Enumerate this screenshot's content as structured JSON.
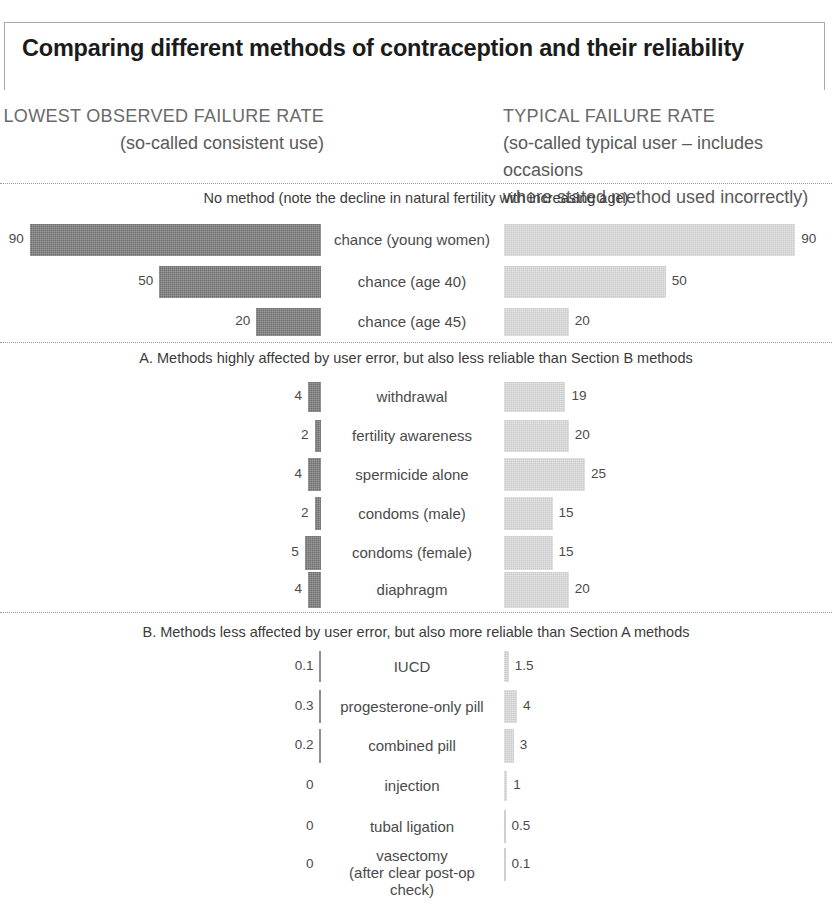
{
  "title": "Comparing different methods of contraception and their reliability",
  "headers": {
    "left_caption": "LOWEST OBSERVED FAILURE RATE",
    "left_subtitle": "(so-called consistent use)",
    "right_caption": "TYPICAL FAILURE RATE",
    "right_subtitle_line1": "(so-called typical user – includes occasions",
    "right_subtitle_line2": "where stated method used incorrectly)"
  },
  "sections": [
    {
      "banner": "No method (note the decline in natural fertility with increasing age)",
      "rows": [
        {
          "label": "chance (young women)",
          "label2": "",
          "lowest": "90",
          "typical": "90"
        },
        {
          "label": "chance (age 40)",
          "label2": "",
          "lowest": "50",
          "typical": "50"
        },
        {
          "label": "chance (age 45)",
          "label2": "",
          "lowest": "20",
          "typical": "20"
        }
      ]
    },
    {
      "banner": "A. Methods highly affected by user error, but also less reliable than Section B methods",
      "rows": [
        {
          "label": "withdrawal",
          "label2": "",
          "lowest": "4",
          "typical": "19"
        },
        {
          "label": "fertility awareness",
          "label2": "",
          "lowest": "2",
          "typical": "20"
        },
        {
          "label": "spermicide alone",
          "label2": "",
          "lowest": "4",
          "typical": "25"
        },
        {
          "label": "condoms (male)",
          "label2": "",
          "lowest": "2",
          "typical": "15"
        },
        {
          "label": "condoms (female)",
          "label2": "",
          "lowest": "5",
          "typical": "15"
        },
        {
          "label": "diaphragm",
          "label2": "",
          "lowest": "4",
          "typical": "20"
        }
      ]
    },
    {
      "banner": "B. Methods less affected by user error, but also more reliable than Section A methods",
      "rows": [
        {
          "label": "IUCD",
          "label2": "",
          "lowest": "0.1",
          "typical": "1.5"
        },
        {
          "label": "progesterone-only pill",
          "label2": "",
          "lowest": "0.3",
          "typical": "4"
        },
        {
          "label": "combined pill",
          "label2": "",
          "lowest": "0.2",
          "typical": "3"
        },
        {
          "label": "injection",
          "label2": "",
          "lowest": "0",
          "typical": "1"
        },
        {
          "label": "tubal ligation",
          "label2": "",
          "lowest": "0",
          "typical": "0.5"
        },
        {
          "label": "vasectomy",
          "label2": "(after clear post-op check)",
          "lowest": "0",
          "typical": "0.1"
        }
      ]
    }
  ],
  "chart_data": {
    "type": "bar",
    "title": "Comparing different methods of contraception and their reliability",
    "orientation": "horizontal-diverging",
    "xlabel": "",
    "ylabel": "",
    "grid": false,
    "legend_position": "top",
    "series": [
      {
        "name": "LOWEST OBSERVED FAILURE RATE (so-called consistent use)",
        "color": "#6e6e6e",
        "direction": "left",
        "values": [
          90,
          50,
          20,
          4,
          2,
          4,
          2,
          5,
          4,
          0.1,
          0.3,
          0.2,
          0,
          0,
          0
        ]
      },
      {
        "name": "TYPICAL FAILURE RATE (so-called typical user – includes occasions where stated method used incorrectly)",
        "color": "#c9c9c9",
        "direction": "right",
        "values": [
          90,
          50,
          20,
          19,
          20,
          25,
          15,
          15,
          20,
          1.5,
          4,
          3,
          1,
          0.5,
          0.1
        ]
      }
    ],
    "categories": [
      "chance (young women)",
      "chance (age 40)",
      "chance (age 45)",
      "withdrawal",
      "fertility awareness",
      "spermicide alone",
      "condoms (male)",
      "condoms (female)",
      "diaphragm",
      "IUCD",
      "progesterone-only pill",
      "combined pill",
      "injection",
      "tubal ligation",
      "vasectomy (after clear post-op check)"
    ],
    "group_labels": [
      "No method (note the decline in natural fertility with increasing age)",
      "A. Methods highly affected by user error, but also less reliable than Section B methods",
      "B. Methods less affected by user error, but also more reliable than Section A methods"
    ],
    "groups": [
      {
        "label": "No method (note the decline in natural fertility with increasing age)",
        "categories": [
          "chance (young women)",
          "chance (age 40)",
          "chance (age 45)"
        ]
      },
      {
        "label": "A. Methods highly affected by user error, but also less reliable than Section B methods",
        "categories": [
          "withdrawal",
          "fertility awareness",
          "spermicide alone",
          "condoms (male)",
          "condoms (female)",
          "diaphragm"
        ]
      },
      {
        "label": "B. Methods less affected by user error, but also more reliable than Section A methods",
        "categories": [
          "IUCD",
          "progesterone-only pill",
          "combined pill",
          "injection",
          "tubal ligation",
          "vasectomy (after clear post-op check)"
        ]
      }
    ],
    "units": "failure rate (pregnancies per 100 women per year)",
    "xlim": [
      0,
      90
    ]
  },
  "layout": {
    "bar_rows": [
      {
        "y": 224,
        "h": 32,
        "lowest": 90,
        "typical": 90
      },
      {
        "y": 266,
        "h": 32,
        "lowest": 50,
        "typical": 50
      },
      {
        "y": 308,
        "h": 28,
        "lowest": 20,
        "typical": 20
      },
      {
        "y": 382,
        "h": 30,
        "lowest": 4,
        "typical": 19
      },
      {
        "y": 420,
        "h": 32,
        "lowest": 2,
        "typical": 20
      },
      {
        "y": 458,
        "h": 33,
        "lowest": 4,
        "typical": 25
      },
      {
        "y": 497,
        "h": 33,
        "lowest": 2,
        "typical": 15
      },
      {
        "y": 536,
        "h": 34,
        "lowest": 5,
        "typical": 15
      },
      {
        "y": 572,
        "h": 36,
        "lowest": 4,
        "typical": 20
      },
      {
        "y": 651,
        "h": 31,
        "lowest": 0.1,
        "typical": 1.5
      },
      {
        "y": 690,
        "h": 33,
        "lowest": 0.3,
        "typical": 4
      },
      {
        "y": 729,
        "h": 34,
        "lowest": 0.2,
        "typical": 3
      },
      {
        "y": 771,
        "h": 30,
        "lowest": 0,
        "typical": 1
      },
      {
        "y": 810,
        "h": 33,
        "lowest": 0,
        "typical": 0.5
      },
      {
        "y": 848,
        "h": 33,
        "lowest": 0,
        "typical": 0.1
      }
    ],
    "scale_px_per_unit": 3.235,
    "left_anchor_x": 321,
    "right_anchor_x": 504,
    "banners": [
      {
        "text_index": 0,
        "y": 198
      },
      {
        "text_index": 1,
        "y": 348
      },
      {
        "text_index": 2,
        "y": 622
      }
    ]
  }
}
